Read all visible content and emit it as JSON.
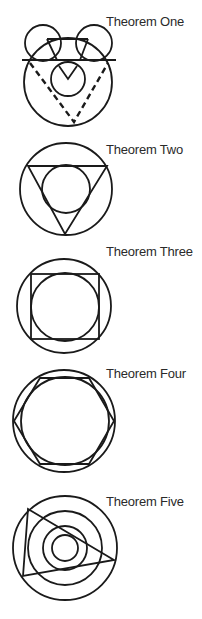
{
  "colors": {
    "background": "#ffffff",
    "ink": "#1a1a1a",
    "label": "#2a2a2a"
  },
  "figures": [
    {
      "id": "theorem-one",
      "label": "Theorem One",
      "label_pos": [
        106,
        15
      ],
      "shapes": {
        "outer_circle": {
          "cx": 68,
          "cy": 82,
          "r": 44
        },
        "left_small_circle": {
          "cx": 43,
          "cy": 43,
          "r": 18
        },
        "right_small_circle": {
          "cx": 94,
          "cy": 43,
          "r": 18
        },
        "inner_circle": {
          "cx": 68,
          "cy": 79,
          "r": 17
        },
        "horizontal_line": {
          "x1": 22,
          "y1": 60,
          "x2": 116,
          "y2": 60
        },
        "dashed_v": [
          [
            30,
            63
          ],
          [
            74,
            122
          ],
          [
            108,
            63
          ]
        ],
        "chord_top": {
          "x1": 47,
          "y1": 39,
          "x2": 88,
          "y2": 39
        },
        "left_v": [
          [
            47,
            39
          ],
          [
            57,
            60
          ],
          [
            40,
            60
          ]
        ],
        "right_v": [
          [
            88,
            39
          ],
          [
            80,
            60
          ],
          [
            96,
            60
          ]
        ],
        "inner_v": [
          [
            59,
            66
          ],
          [
            68,
            79
          ],
          [
            77,
            66
          ]
        ]
      }
    },
    {
      "id": "theorem-two",
      "label": "Theorem Two",
      "label_pos": [
        106,
        143
      ],
      "shapes": {
        "outer_circle": {
          "cx": 66,
          "cy": 189,
          "r": 46
        },
        "triangle": [
          [
            28,
            166
          ],
          [
            107,
            166
          ],
          [
            65,
            234
          ]
        ],
        "inner_circle": {
          "cx": 66,
          "cy": 189,
          "r": 24
        }
      }
    },
    {
      "id": "theorem-three",
      "label": "Theorem Three",
      "label_pos": [
        106,
        245
      ],
      "shapes": {
        "outer_circle": {
          "cx": 64,
          "cy": 306,
          "r": 47
        },
        "square": {
          "x": 31,
          "y": 274,
          "w": 68,
          "h": 65
        },
        "inner_circle": {
          "cx": 65,
          "cy": 307,
          "r": 34
        }
      }
    },
    {
      "id": "theorem-four",
      "label": "Theorem Four",
      "label_pos": [
        106,
        367
      ],
      "shapes": {
        "outer_circle": {
          "cx": 64,
          "cy": 421,
          "r": 51
        },
        "hexagon": [
          [
            14,
            421
          ],
          [
            40,
            378
          ],
          [
            89,
            378
          ],
          [
            114,
            421
          ],
          [
            89,
            464
          ],
          [
            40,
            464
          ]
        ],
        "inner_circle": {
          "cx": 65,
          "cy": 421,
          "r": 44
        }
      }
    },
    {
      "id": "theorem-five",
      "label": "Theorem Five",
      "label_pos": [
        106,
        495
      ],
      "shapes": {
        "circles": [
          {
            "cx": 65,
            "cy": 548,
            "r": 52
          },
          {
            "cx": 65,
            "cy": 548,
            "r": 37
          },
          {
            "cx": 65,
            "cy": 548,
            "r": 22
          },
          {
            "cx": 65,
            "cy": 548,
            "r": 13
          }
        ],
        "triangle": [
          [
            28,
            509
          ],
          [
            114,
            560
          ],
          [
            23,
            576
          ]
        ]
      }
    }
  ]
}
